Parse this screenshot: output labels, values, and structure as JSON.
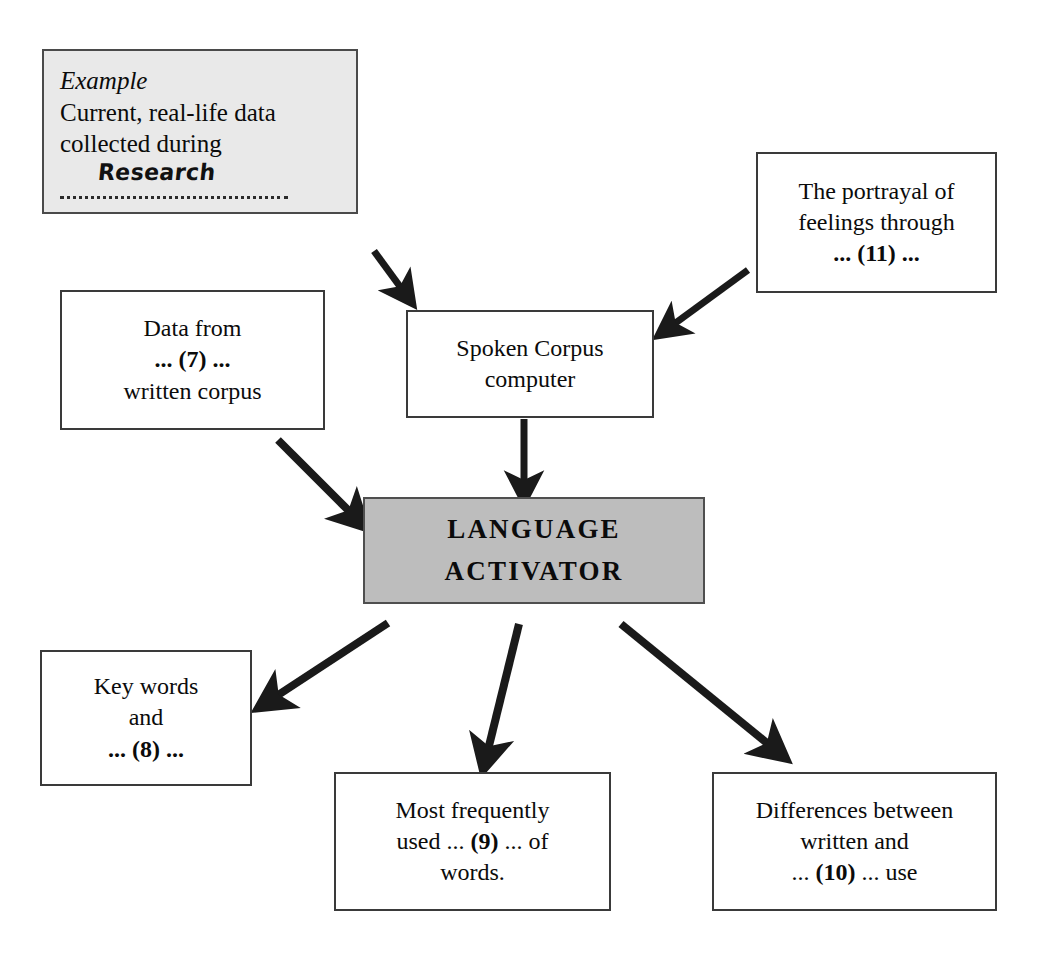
{
  "diagram": {
    "background_color": "#ffffff",
    "box_border_color": "#3a3a3a",
    "example_fill_color": "#e9e9e9",
    "center_fill_color": "#bdbdbd",
    "arrow_color": "#1a1a1a"
  },
  "nodes": {
    "example": {
      "label": "Example",
      "line1": "Current, real-life data",
      "line2": "collected during",
      "answer_written": "Research"
    },
    "portrayal": {
      "line1": "The portrayal of",
      "line2": "feelings through",
      "line3": "... (11) ..."
    },
    "data_from": {
      "line1": "Data from",
      "line2": "... (7) ...",
      "line3": "written corpus"
    },
    "spoken_corpus": {
      "line1": "Spoken Corpus",
      "line2": "computer"
    },
    "activator": {
      "line1": "LANGUAGE",
      "line2": "ACTIVATOR"
    },
    "key_words": {
      "line1": "Key words",
      "line2": "and",
      "line3": "... (8) ..."
    },
    "most_frequent": {
      "line1": "Most frequently",
      "line2": "used ... (9) ... of",
      "line3": "words."
    },
    "differences": {
      "line1": "Differences between",
      "line2": "written and",
      "line3": "... (10) ... use"
    }
  },
  "arrows": [
    {
      "name": "arrow-example-to-spoken-corpus",
      "from": "example",
      "to": "spoken_corpus"
    },
    {
      "name": "arrow-portrayal-to-spoken-corpus",
      "from": "portrayal",
      "to": "spoken_corpus"
    },
    {
      "name": "arrow-data-from-to-activator",
      "from": "data_from",
      "to": "activator"
    },
    {
      "name": "arrow-spoken-corpus-to-activator",
      "from": "spoken_corpus",
      "to": "activator"
    },
    {
      "name": "arrow-activator-to-key-words",
      "from": "activator",
      "to": "key_words"
    },
    {
      "name": "arrow-activator-to-most-frequent",
      "from": "activator",
      "to": "most_frequent"
    },
    {
      "name": "arrow-activator-to-differences",
      "from": "activator",
      "to": "differences"
    }
  ]
}
